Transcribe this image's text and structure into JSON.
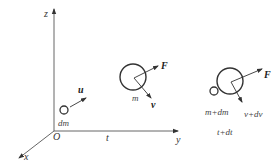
{
  "diagram": {
    "axes": {
      "z_label": "z",
      "y_label": "y",
      "x_label": "x",
      "origin_label": "O",
      "t_label": "t"
    },
    "particle": {
      "mass_label": "dm",
      "velocity_label": "u"
    },
    "body_t": {
      "mass_label": "m",
      "force_label": "F",
      "velocity_label": "v"
    },
    "body_t_dt": {
      "mass_label": "m+dm",
      "force_label": "F",
      "velocity_label": "v+dv",
      "time_label": "t+dt"
    },
    "colors": {
      "line": "#444444",
      "text": "#333333"
    }
  }
}
